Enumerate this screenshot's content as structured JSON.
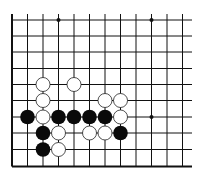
{
  "board": {
    "description": "Partial Go board diagram (lower-left corner region)",
    "grid": {
      "x_lines": [
        12,
        27.5,
        43,
        58.5,
        74,
        89.5,
        105,
        120.5,
        136,
        151.5,
        167,
        182.5
      ],
      "y_lines": [
        20,
        36,
        52,
        68.5,
        84.5,
        100.5,
        117,
        133,
        149.5,
        166.5
      ],
      "x_end": 192,
      "left_edge_thick": true,
      "bottom_edge_thick": true
    },
    "hoshi": [
      {
        "col": 3,
        "row": 0
      },
      {
        "col": 9,
        "row": 0
      },
      {
        "col": 9,
        "row": 6
      }
    ],
    "stones": [
      {
        "color": "white",
        "col": 2,
        "row": 4
      },
      {
        "color": "white",
        "col": 4,
        "row": 4
      },
      {
        "color": "white",
        "col": 2,
        "row": 5
      },
      {
        "color": "white",
        "col": 6,
        "row": 5
      },
      {
        "color": "white",
        "col": 7,
        "row": 5
      },
      {
        "color": "black",
        "col": 1,
        "row": 6
      },
      {
        "color": "white",
        "col": 2,
        "row": 6
      },
      {
        "color": "black",
        "col": 3,
        "row": 6
      },
      {
        "color": "black",
        "col": 4,
        "row": 6
      },
      {
        "color": "black",
        "col": 5,
        "row": 6
      },
      {
        "color": "black",
        "col": 6,
        "row": 6
      },
      {
        "color": "white",
        "col": 7,
        "row": 6
      },
      {
        "color": "black",
        "col": 2,
        "row": 7
      },
      {
        "color": "white",
        "col": 3,
        "row": 7
      },
      {
        "color": "white",
        "col": 5,
        "row": 7
      },
      {
        "color": "white",
        "col": 6,
        "row": 7
      },
      {
        "color": "black",
        "col": 7,
        "row": 7
      },
      {
        "color": "black",
        "col": 2,
        "row": 8
      },
      {
        "color": "white",
        "col": 3,
        "row": 8
      }
    ],
    "colors": {
      "line": "#111111",
      "black_stone": "#0a0a0a",
      "white_stone_fill": "#ffffff",
      "white_stone_stroke": "#222222"
    }
  }
}
